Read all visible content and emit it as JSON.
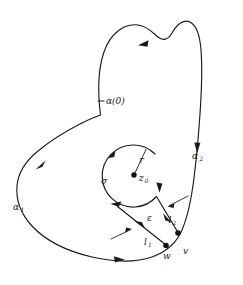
{
  "figure": {
    "background_color": "#ffffff",
    "stroke_color": "#1a1a1a",
    "width": 243,
    "height": 285,
    "caption": ""
  },
  "labels": {
    "alpha_zero": "α(0)",
    "alpha_one_base": "α",
    "alpha_one_sub": "1",
    "alpha_two_base": "α",
    "alpha_two_sub": "2",
    "sigma": "σ",
    "radius": "r",
    "center_base": "z",
    "center_sub": "0",
    "epsilon": "ε",
    "segment_one_base": "l",
    "segment_one_sub": "1",
    "segment_two_base": "l",
    "segment_two_sub": "2",
    "point_w": "w",
    "point_v": "v"
  },
  "geometry": {
    "outer_contour_path": "M 100.5 115 C 98 95 97 72 104 52 C 110 34 124 23 138 25 C 148 26.5 153 33 158 37 C 163 41 168 40 172 33 C 177 24 184 19 190 22 C 197 25.5 200 37 201 50 C 202.5 69 201.5 92 200 114 C 198.5 136 196.5 158 194 178 C 191.5 198 188 216 182 230 C 176 244 166 252 152 257 C 136 262.5 114 262 92 257 C 68 251.5 46 241 32 226 C 20 213 16 198 17 186 C 18 172 27 160 38 151 C 52 139.5 68 130 82 123 C 90 119 96 116.5 100.5 115 Z",
    "circle_center": [
      134,
      175
    ],
    "circle_radius": 31,
    "sigma_arc_path": "M 156.5 196.5 A 31 31 0 1 1 155 154",
    "slit_upper_path": "M 156.5 196.5 L 178 232.5",
    "slit_lower_path": "M 117.5 206.5 L 166 245",
    "slit_connector_path": "M 117.5 206.5 L 155 154",
    "radius_line": "M 134 175 L 146 149.5",
    "tick_alpha_zero": "M 98 101 L 104 101",
    "dots": [
      {
        "name": "z0-center-dot",
        "cx": 134,
        "cy": 175,
        "r": 2.6
      },
      {
        "name": "w-vertex-dot",
        "cx": 166,
        "cy": 245.5,
        "r": 2.7
      },
      {
        "name": "v-vertex-dot",
        "cx": 178,
        "cy": 233,
        "r": 2.7
      }
    ],
    "label_positions": {
      "alpha_zero": [
        107,
        101
      ],
      "alpha_one": [
        17,
        207
      ],
      "alpha_two": [
        193,
        156
      ],
      "sigma": [
        104,
        180
      ],
      "radius": [
        141,
        160
      ],
      "center": [
        140,
        178
      ],
      "epsilon": [
        149,
        218
      ],
      "segment_one": [
        146,
        243
      ],
      "segment_two": [
        170,
        220
      ],
      "point_w": [
        166,
        256
      ],
      "point_v": [
        185,
        250
      ]
    }
  },
  "arrows": [
    {
      "name": "outer-top-arrow",
      "direction": "left",
      "x": 143,
      "y": 44
    },
    {
      "name": "outer-right-arrow",
      "direction": "down",
      "x": 197,
      "y": 147
    },
    {
      "name": "outer-left-arrow",
      "direction": "down-left",
      "x": 40,
      "y": 165
    },
    {
      "name": "outer-bottom-arrow",
      "direction": "right",
      "x": 118,
      "y": 259
    },
    {
      "name": "sigma-upper-left-arrow",
      "direction": "clockwise",
      "x": 112,
      "y": 154
    },
    {
      "name": "sigma-right-arrow",
      "direction": "down",
      "x": 160,
      "y": 186
    },
    {
      "name": "slit-lower-arrow",
      "direction": "up-left",
      "x": 138,
      "y": 224
    },
    {
      "name": "slit-upper-arrow",
      "direction": "down-right",
      "x": 168,
      "y": 218
    },
    {
      "name": "epsilon-pointer-upper",
      "direction": "down-left",
      "x": 172,
      "y": 203
    },
    {
      "name": "epsilon-pointer-lower",
      "direction": "up-right",
      "x": 128,
      "y": 234
    }
  ]
}
